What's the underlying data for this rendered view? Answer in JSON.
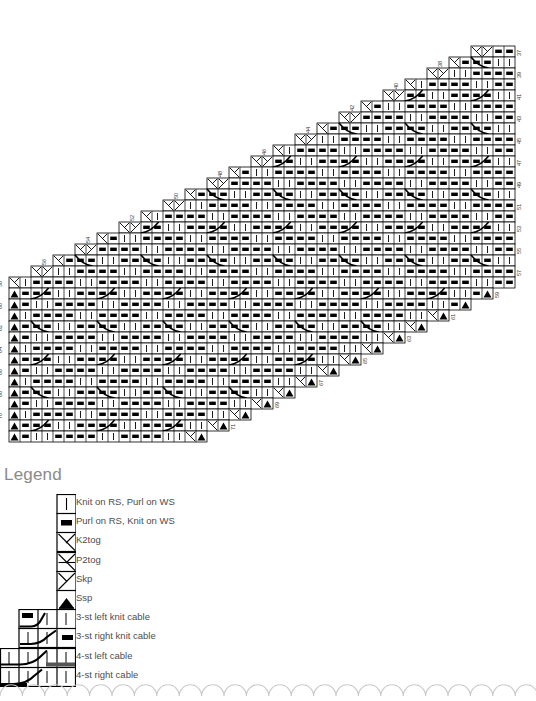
{
  "document": {
    "type": "knitting-chart",
    "title_visible": false
  },
  "legend": {
    "title": "Legend",
    "entries": [
      {
        "symbol": "knit",
        "label": "Knit on RS, Purl on WS",
        "cells": 1
      },
      {
        "symbol": "purl",
        "label": "Purl on RS, Knit on WS",
        "cells": 1
      },
      {
        "symbol": "k2tog",
        "label": "K2tog",
        "cells": 1
      },
      {
        "symbol": "p2tog",
        "label": "P2tog",
        "cells": 1
      },
      {
        "symbol": "skp",
        "label": "Skp",
        "cells": 1
      },
      {
        "symbol": "ssp",
        "label": "Ssp",
        "cells": 1
      },
      {
        "symbol": "cable-3-left-knit",
        "label": "3-st left knit cable",
        "cells": 3
      },
      {
        "symbol": "cable-3-right-knit",
        "label": "3-st right knit cable",
        "cells": 3
      },
      {
        "symbol": "cable-4-left",
        "label": "4-st left cable",
        "cells": 4
      },
      {
        "symbol": "cable-4-right",
        "label": "4-st right cable",
        "cells": 4
      }
    ]
  },
  "chart": {
    "cell_size": 11,
    "rows_total": 36,
    "row_numbers_right": [
      37,
      39,
      41,
      43,
      45,
      47,
      49,
      51,
      53,
      55,
      57,
      59,
      61,
      63,
      65,
      67,
      69,
      71
    ],
    "row_numbers_left": [
      38,
      40,
      42,
      44,
      46,
      48,
      50,
      52,
      54,
      56,
      58,
      60,
      62,
      64,
      66,
      68,
      70
    ],
    "grid_right_edge_x": 515,
    "grid_top_y": 46,
    "stitch_symbols_used": [
      "knit",
      "purl",
      "k2tog",
      "p2tog",
      "skp",
      "ssp",
      "cable-3-left-knit",
      "cable-3-right-knit",
      "cable-4-left",
      "cable-4-right"
    ],
    "shape": "right-triangle-staircase",
    "colors": {
      "grid_line": "#000000",
      "symbol": "#000000",
      "text": "#4d4d4d",
      "title": "#8a8a8a",
      "border_scallop": "#c8c8c8"
    }
  }
}
